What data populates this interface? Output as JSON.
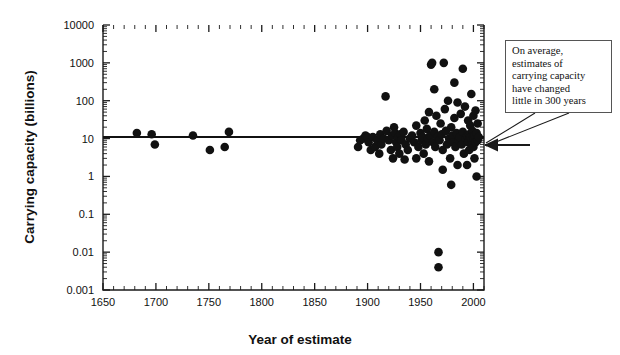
{
  "figure": {
    "width": 620,
    "height": 355,
    "background": "#ffffff",
    "ink_color": "#111111"
  },
  "annotation": {
    "text": "On average,\nestimates of\ncarrying capacity\nhave changed\nlittle in 300 years",
    "box": {
      "x": 505,
      "y": 40,
      "width": 107,
      "height": 73
    },
    "arrow_target": {
      "x": 484,
      "y": 145
    }
  },
  "chart_data": {
    "type": "scatter",
    "title": "",
    "xlabel": "Year of estimate",
    "ylabel": "Carrying capacity (billions)",
    "xlim": [
      1650,
      2010
    ],
    "ylim": [
      0.001,
      10000
    ],
    "yscale": "log",
    "xscale": "linear",
    "grid": false,
    "legend": null,
    "xticks": [
      1650,
      1700,
      1750,
      1800,
      1850,
      1900,
      1950,
      2000
    ],
    "xtick_labels": [
      "1650",
      "1700",
      "1750",
      "1800",
      "1850",
      "1900",
      "1950",
      "2000"
    ],
    "x_minor_tick_step": 10,
    "yticks": [
      0.001,
      0.01,
      0.1,
      1,
      10,
      100,
      1000,
      10000
    ],
    "ytick_labels": [
      "0.001",
      "0.01",
      "0.1",
      "1",
      "10",
      "100",
      "1000",
      "10000"
    ],
    "trend": {
      "kind": "horizontal-line",
      "value": 11,
      "x_from": 1650,
      "x_to": 2010,
      "label": "average estimate"
    },
    "points": [
      {
        "x": 1682,
        "y": 14
      },
      {
        "x": 1696,
        "y": 13
      },
      {
        "x": 1699,
        "y": 7
      },
      {
        "x": 1735,
        "y": 12
      },
      {
        "x": 1751,
        "y": 5
      },
      {
        "x": 1765,
        "y": 6
      },
      {
        "x": 1769,
        "y": 15
      },
      {
        "x": 1891,
        "y": 6
      },
      {
        "x": 1893,
        "y": 9
      },
      {
        "x": 1896,
        "y": 10
      },
      {
        "x": 1898,
        "y": 12
      },
      {
        "x": 1900,
        "y": 11
      },
      {
        "x": 1901,
        "y": 8
      },
      {
        "x": 1903,
        "y": 5
      },
      {
        "x": 1905,
        "y": 11
      },
      {
        "x": 1907,
        "y": 6
      },
      {
        "x": 1909,
        "y": 9
      },
      {
        "x": 1911,
        "y": 4
      },
      {
        "x": 1912,
        "y": 13
      },
      {
        "x": 1913,
        "y": 7
      },
      {
        "x": 1915,
        "y": 10
      },
      {
        "x": 1917,
        "y": 130
      },
      {
        "x": 1918,
        "y": 16
      },
      {
        "x": 1920,
        "y": 9
      },
      {
        "x": 1922,
        "y": 5
      },
      {
        "x": 1923,
        "y": 12
      },
      {
        "x": 1924,
        "y": 3
      },
      {
        "x": 1925,
        "y": 20
      },
      {
        "x": 1926,
        "y": 14
      },
      {
        "x": 1927,
        "y": 8
      },
      {
        "x": 1928,
        "y": 6
      },
      {
        "x": 1929,
        "y": 11
      },
      {
        "x": 1930,
        "y": 4
      },
      {
        "x": 1931,
        "y": 13
      },
      {
        "x": 1932,
        "y": 9
      },
      {
        "x": 1934,
        "y": 15
      },
      {
        "x": 1936,
        "y": 7
      },
      {
        "x": 1938,
        "y": 5
      },
      {
        "x": 1940,
        "y": 10
      },
      {
        "x": 1942,
        "y": 12
      },
      {
        "x": 1944,
        "y": 8
      },
      {
        "x": 1946,
        "y": 22
      },
      {
        "x": 1948,
        "y": 6
      },
      {
        "x": 1950,
        "y": 14
      },
      {
        "x": 1951,
        "y": 9
      },
      {
        "x": 1952,
        "y": 11
      },
      {
        "x": 1953,
        "y": 4
      },
      {
        "x": 1954,
        "y": 30
      },
      {
        "x": 1955,
        "y": 7
      },
      {
        "x": 1956,
        "y": 18
      },
      {
        "x": 1957,
        "y": 10
      },
      {
        "x": 1958,
        "y": 50
      },
      {
        "x": 1959,
        "y": 12
      },
      {
        "x": 1960,
        "y": 900
      },
      {
        "x": 1961,
        "y": 1000
      },
      {
        "x": 1962,
        "y": 8
      },
      {
        "x": 1963,
        "y": 15
      },
      {
        "x": 1964,
        "y": 6
      },
      {
        "x": 1965,
        "y": 40
      },
      {
        "x": 1966,
        "y": 11
      },
      {
        "x": 1967,
        "y": 0.01
      },
      {
        "x": 1967,
        "y": 0.004
      },
      {
        "x": 1968,
        "y": 9
      },
      {
        "x": 1969,
        "y": 25
      },
      {
        "x": 1970,
        "y": 13
      },
      {
        "x": 1971,
        "y": 5
      },
      {
        "x": 1972,
        "y": 1000
      },
      {
        "x": 1973,
        "y": 60
      },
      {
        "x": 1974,
        "y": 16
      },
      {
        "x": 1975,
        "y": 7
      },
      {
        "x": 1976,
        "y": 100
      },
      {
        "x": 1977,
        "y": 10
      },
      {
        "x": 1978,
        "y": 3
      },
      {
        "x": 1979,
        "y": 20
      },
      {
        "x": 1980,
        "y": 12
      },
      {
        "x": 1981,
        "y": 8
      },
      {
        "x": 1982,
        "y": 35
      },
      {
        "x": 1983,
        "y": 6
      },
      {
        "x": 1984,
        "y": 14
      },
      {
        "x": 1985,
        "y": 90
      },
      {
        "x": 1986,
        "y": 9
      },
      {
        "x": 1987,
        "y": 11
      },
      {
        "x": 1988,
        "y": 45
      },
      {
        "x": 1989,
        "y": 7
      },
      {
        "x": 1990,
        "y": 15
      },
      {
        "x": 1991,
        "y": 4
      },
      {
        "x": 1992,
        "y": 70
      },
      {
        "x": 1993,
        "y": 10
      },
      {
        "x": 1994,
        "y": 12
      },
      {
        "x": 1994,
        "y": 2
      },
      {
        "x": 1995,
        "y": 30
      },
      {
        "x": 1995,
        "y": 8
      },
      {
        "x": 1996,
        "y": 13
      },
      {
        "x": 1996,
        "y": 5
      },
      {
        "x": 1997,
        "y": 11
      },
      {
        "x": 1997,
        "y": 22
      },
      {
        "x": 1998,
        "y": 9
      },
      {
        "x": 1998,
        "y": 150
      },
      {
        "x": 1999,
        "y": 7
      },
      {
        "x": 1999,
        "y": 16
      },
      {
        "x": 2000,
        "y": 10
      },
      {
        "x": 2000,
        "y": 6
      },
      {
        "x": 2000,
        "y": 40
      },
      {
        "x": 2001,
        "y": 12
      },
      {
        "x": 2001,
        "y": 3
      },
      {
        "x": 2002,
        "y": 8
      },
      {
        "x": 2002,
        "y": 55
      },
      {
        "x": 2003,
        "y": 14
      },
      {
        "x": 2003,
        "y": 1
      },
      {
        "x": 2004,
        "y": 9
      },
      {
        "x": 2004,
        "y": 25
      },
      {
        "x": 2005,
        "y": 11
      },
      {
        "x": 1979,
        "y": 0.6
      },
      {
        "x": 1971,
        "y": 1.5
      },
      {
        "x": 1985,
        "y": 2
      },
      {
        "x": 1958,
        "y": 2.5
      },
      {
        "x": 1946,
        "y": 3
      },
      {
        "x": 1935,
        "y": 2.8
      },
      {
        "x": 1990,
        "y": 700
      },
      {
        "x": 1982,
        "y": 300
      },
      {
        "x": 1963,
        "y": 200
      }
    ]
  }
}
